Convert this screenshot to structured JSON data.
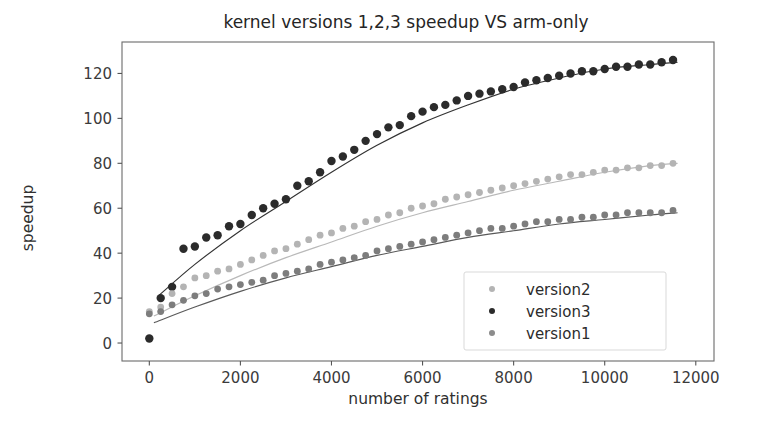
{
  "figure": {
    "title": "kernel versions 1,2,3 speedup VS arm-only",
    "background": "#ffffff"
  },
  "axes": {
    "xlabel": "number of ratings",
    "ylabel": "speedup",
    "xticks": [
      "0",
      "2000",
      "4000",
      "6000",
      "8000",
      "10000",
      "12000"
    ],
    "yticks": [
      "0",
      "20",
      "40",
      "60",
      "80",
      "100",
      "120"
    ]
  },
  "legend": {
    "entries": [
      {
        "label": "version2",
        "color": "#b4b4b4",
        "marker": "point"
      },
      {
        "label": "version3",
        "color": "#2b2b2b",
        "marker": "point"
      },
      {
        "label": "version1",
        "color": "#8c8c8c",
        "marker": "point"
      }
    ]
  },
  "chart_data": {
    "type": "scatter",
    "title": "kernel versions 1,2,3 speedup VS arm-only",
    "xlabel": "number of ratings",
    "ylabel": "speedup",
    "xlim": [
      -600,
      12400
    ],
    "ylim": [
      -8,
      134
    ],
    "xticks": [
      0,
      2000,
      4000,
      6000,
      8000,
      10000,
      12000
    ],
    "yticks": [
      0,
      20,
      40,
      60,
      80,
      100,
      120
    ],
    "grid": false,
    "legend_position": "lower right",
    "series": [
      {
        "name": "version3",
        "color": "#2b2b2b",
        "marker_size": 4.2,
        "fit_color": "#333333",
        "x": [
          0,
          250,
          500,
          750,
          1000,
          1250,
          1500,
          1750,
          2000,
          2250,
          2500,
          2750,
          3000,
          3250,
          3500,
          3750,
          4000,
          4250,
          4500,
          4750,
          5000,
          5250,
          5500,
          5750,
          6000,
          6250,
          6500,
          6750,
          7000,
          7250,
          7500,
          7750,
          8000,
          8250,
          8500,
          8750,
          9000,
          9250,
          9500,
          9750,
          10000,
          10250,
          10500,
          10750,
          11000,
          11250,
          11500
        ],
        "y": [
          2,
          20,
          25,
          42,
          43,
          47,
          48,
          52,
          53,
          57,
          60,
          62,
          64,
          70,
          72,
          76,
          81,
          83,
          86,
          90,
          93,
          96,
          97,
          101,
          103,
          105,
          106,
          108,
          110,
          111,
          112,
          113,
          114,
          116,
          117,
          118,
          119,
          120,
          121,
          121,
          122,
          123,
          123,
          124,
          124,
          125,
          126
        ],
        "fit": {
          "kind": "saturating",
          "x": [
            200,
            1000,
            2000,
            3000,
            4000,
            5000,
            6000,
            7000,
            8000,
            9000,
            10000,
            11000,
            11600
          ],
          "y": [
            21,
            35,
            50,
            63,
            76,
            88,
            98,
            106,
            113,
            118,
            122,
            124,
            125
          ]
        }
      },
      {
        "name": "version2",
        "color": "#b4b4b4",
        "marker_size": 3.4,
        "fit_color": "#b9b9b9",
        "x": [
          0,
          250,
          500,
          750,
          1000,
          1250,
          1500,
          1750,
          2000,
          2250,
          2500,
          2750,
          3000,
          3250,
          3500,
          3750,
          4000,
          4250,
          4500,
          4750,
          5000,
          5250,
          5500,
          5750,
          6000,
          6250,
          6500,
          6750,
          7000,
          7250,
          7500,
          7750,
          8000,
          8250,
          8500,
          8750,
          9000,
          9250,
          9500,
          9750,
          10000,
          10250,
          10500,
          10750,
          11000,
          11250,
          11500
        ],
        "y": [
          14,
          16,
          22,
          25,
          29,
          30,
          32,
          33,
          35,
          37,
          39,
          41,
          42,
          44,
          46,
          48,
          49,
          51,
          52,
          54,
          55,
          57,
          58,
          60,
          61,
          62,
          64,
          65,
          66,
          67,
          68,
          69,
          70,
          71,
          72,
          73,
          74,
          75,
          75,
          76,
          77,
          77,
          78,
          78,
          79,
          79,
          80
        ],
        "fit": {
          "kind": "saturating",
          "x": [
            100,
            1000,
            2000,
            3000,
            4000,
            5000,
            6000,
            7000,
            8000,
            9000,
            10000,
            11000,
            11600
          ],
          "y": [
            12,
            21,
            30,
            38,
            45,
            52,
            58,
            63,
            68,
            72,
            76,
            79,
            80
          ]
        }
      },
      {
        "name": "version1",
        "color": "#7d7d7d",
        "marker_size": 3.4,
        "fit_color": "#5a5a5a",
        "x": [
          0,
          250,
          500,
          750,
          1000,
          1250,
          1500,
          1750,
          2000,
          2250,
          2500,
          2750,
          3000,
          3250,
          3500,
          3750,
          4000,
          4250,
          4500,
          4750,
          5000,
          5250,
          5500,
          5750,
          6000,
          6250,
          6500,
          6750,
          7000,
          7250,
          7500,
          7750,
          8000,
          8250,
          8500,
          8750,
          9000,
          9250,
          9500,
          9750,
          10000,
          10250,
          10500,
          10750,
          11000,
          11250,
          11500
        ],
        "y": [
          13,
          14,
          17,
          19,
          21,
          22,
          24,
          25,
          26,
          27,
          28,
          30,
          31,
          32,
          33,
          35,
          36,
          37,
          38,
          39,
          41,
          42,
          43,
          44,
          45,
          46,
          47,
          48,
          49,
          50,
          51,
          51,
          52,
          53,
          54,
          54,
          55,
          55,
          56,
          56,
          57,
          57,
          58,
          58,
          58,
          58,
          59
        ],
        "fit": {
          "kind": "saturating",
          "x": [
            100,
            1000,
            2000,
            3000,
            4000,
            5000,
            6000,
            7000,
            8000,
            9000,
            10000,
            11000,
            11600
          ],
          "y": [
            9,
            16,
            23,
            29,
            34,
            39,
            43,
            47,
            50,
            53,
            55,
            57,
            58
          ]
        }
      }
    ]
  }
}
